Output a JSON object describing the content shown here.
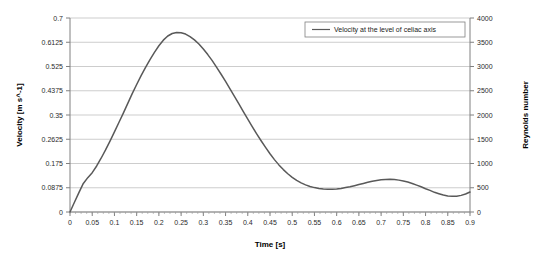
{
  "chart_data": {
    "type": "line",
    "title": "",
    "xlabel": "Time [s]",
    "ylabel": "Velocity [m s^-1]",
    "y2label": "Reynolds number",
    "xlim": [
      0,
      0.9
    ],
    "ylim": [
      0,
      0.7
    ],
    "y2lim": [
      0,
      4000
    ],
    "grid": true,
    "legend_position": "top-right",
    "xticks": [
      "0",
      "0.05",
      "0.1",
      "0.15",
      "0.2",
      "0.25",
      "0.3",
      "0.35",
      "0.4",
      "0.45",
      "0.5",
      "0.55",
      "0.6",
      "0.65",
      "0.7",
      "0.75",
      "0.8",
      "0.85",
      "0.9"
    ],
    "xtick_values": [
      0,
      0.05,
      0.1,
      0.15,
      0.2,
      0.25,
      0.3,
      0.35,
      0.4,
      0.45,
      0.5,
      0.55,
      0.6,
      0.65,
      0.7,
      0.75,
      0.8,
      0.85,
      0.9
    ],
    "yticks": [
      "0",
      "0.0875",
      "0.175",
      "0.2625",
      "0.35",
      "0.4375",
      "0.525",
      "0.6125",
      "0.7"
    ],
    "ytick_values": [
      0,
      0.0875,
      0.175,
      0.2625,
      0.35,
      0.4375,
      0.525,
      0.6125,
      0.7
    ],
    "y2ticks": [
      "0",
      "500",
      "1000",
      "1500",
      "2000",
      "2500",
      "3000",
      "3500",
      "4000"
    ],
    "y2tick_values": [
      0,
      500,
      1000,
      1500,
      2000,
      2500,
      3000,
      3500,
      4000
    ],
    "series": [
      {
        "name": "Velocity at the level of celiac axis",
        "color": "#595959",
        "x": [
          0,
          0.01,
          0.02,
          0.03,
          0.04,
          0.05,
          0.06,
          0.07,
          0.08,
          0.09,
          0.1,
          0.11,
          0.12,
          0.13,
          0.14,
          0.15,
          0.16,
          0.17,
          0.18,
          0.19,
          0.2,
          0.21,
          0.22,
          0.23,
          0.24,
          0.25,
          0.26,
          0.27,
          0.28,
          0.29,
          0.3,
          0.31,
          0.32,
          0.33,
          0.34,
          0.35,
          0.36,
          0.37,
          0.38,
          0.39,
          0.4,
          0.41,
          0.42,
          0.43,
          0.44,
          0.45,
          0.46,
          0.47,
          0.48,
          0.49,
          0.5,
          0.51,
          0.52,
          0.53,
          0.54,
          0.55,
          0.56,
          0.57,
          0.58,
          0.59,
          0.6,
          0.61,
          0.62,
          0.63,
          0.64,
          0.65,
          0.66,
          0.67,
          0.68,
          0.69,
          0.7,
          0.71,
          0.72,
          0.73,
          0.74,
          0.75,
          0.76,
          0.77,
          0.78,
          0.79,
          0.8,
          0.81,
          0.82,
          0.83,
          0.84,
          0.85,
          0.86,
          0.87,
          0.88,
          0.89,
          0.9
        ],
        "y": [
          0.0,
          0.035,
          0.07,
          0.103,
          0.124,
          0.142,
          0.166,
          0.194,
          0.224,
          0.256,
          0.289,
          0.323,
          0.357,
          0.392,
          0.427,
          0.46,
          0.492,
          0.522,
          0.55,
          0.576,
          0.6,
          0.62,
          0.635,
          0.644,
          0.648,
          0.647,
          0.642,
          0.633,
          0.621,
          0.606,
          0.588,
          0.568,
          0.546,
          0.522,
          0.497,
          0.471,
          0.444,
          0.417,
          0.39,
          0.362,
          0.335,
          0.308,
          0.282,
          0.257,
          0.233,
          0.21,
          0.189,
          0.17,
          0.153,
          0.138,
          0.125,
          0.114,
          0.105,
          0.098,
          0.092,
          0.088,
          0.085,
          0.083,
          0.082,
          0.082,
          0.083,
          0.085,
          0.088,
          0.091,
          0.095,
          0.099,
          0.103,
          0.107,
          0.111,
          0.114,
          0.116,
          0.117,
          0.118,
          0.117,
          0.115,
          0.112,
          0.108,
          0.103,
          0.097,
          0.091,
          0.084,
          0.078,
          0.071,
          0.066,
          0.061,
          0.058,
          0.057,
          0.057,
          0.06,
          0.065,
          0.072
        ]
      }
    ]
  },
  "legend": {
    "entries": [
      {
        "label": "Velocity at the level of celiac axis",
        "color": "#595959"
      }
    ]
  }
}
